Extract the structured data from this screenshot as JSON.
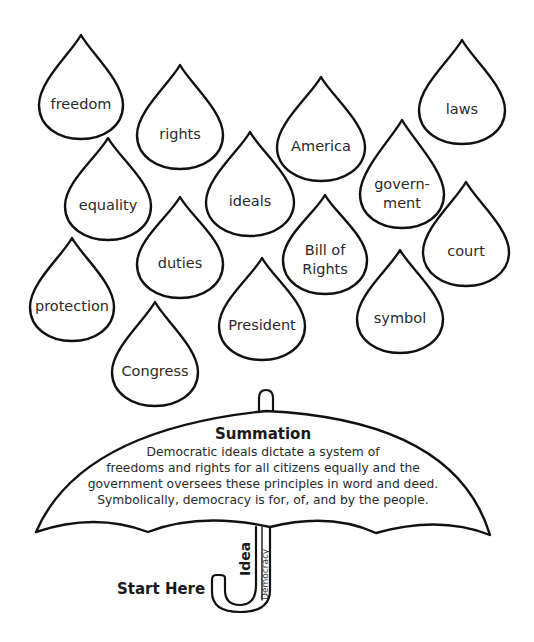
{
  "drops": [
    {
      "id": "freedom",
      "lines": [
        "freedom"
      ],
      "tip": [
        81,
        35
      ],
      "cx": 81,
      "cy": 103,
      "rx": 42,
      "ry": 36
    },
    {
      "id": "rights",
      "lines": [
        "rights"
      ],
      "tip": [
        180,
        65
      ],
      "cx": 180,
      "cy": 133,
      "rx": 43,
      "ry": 36
    },
    {
      "id": "america",
      "lines": [
        "America"
      ],
      "tip": [
        321,
        77
      ],
      "cx": 321,
      "cy": 145,
      "rx": 44,
      "ry": 36
    },
    {
      "id": "laws",
      "lines": [
        "laws"
      ],
      "tip": [
        462,
        40
      ],
      "cx": 462,
      "cy": 108,
      "rx": 43,
      "ry": 36
    },
    {
      "id": "equality",
      "lines": [
        "equality"
      ],
      "tip": [
        108,
        138
      ],
      "cx": 108,
      "cy": 204,
      "rx": 43,
      "ry": 36
    },
    {
      "id": "ideals",
      "lines": [
        "ideals"
      ],
      "tip": [
        250,
        132
      ],
      "cx": 250,
      "cy": 200,
      "rx": 44,
      "ry": 36
    },
    {
      "id": "government",
      "lines": [
        "govern-",
        "ment"
      ],
      "tip": [
        402,
        120
      ],
      "cx": 402,
      "cy": 192,
      "rx": 42,
      "ry": 36
    },
    {
      "id": "duties",
      "lines": [
        "duties"
      ],
      "tip": [
        180,
        197
      ],
      "cx": 180,
      "cy": 262,
      "rx": 43,
      "ry": 36
    },
    {
      "id": "bill-of-rights",
      "lines": [
        "Bill of",
        "Rights"
      ],
      "tip": [
        325,
        195
      ],
      "cx": 325,
      "cy": 258,
      "rx": 42,
      "ry": 36
    },
    {
      "id": "court",
      "lines": [
        "court"
      ],
      "tip": [
        466,
        182
      ],
      "cx": 466,
      "cy": 250,
      "rx": 43,
      "ry": 36
    },
    {
      "id": "protection",
      "lines": [
        "protection"
      ],
      "tip": [
        72,
        238
      ],
      "cx": 72,
      "cy": 305,
      "rx": 42,
      "ry": 36
    },
    {
      "id": "president",
      "lines": [
        "President"
      ],
      "tip": [
        262,
        258
      ],
      "cx": 262,
      "cy": 324,
      "rx": 43,
      "ry": 36
    },
    {
      "id": "symbol",
      "lines": [
        "symbol"
      ],
      "tip": [
        400,
        250
      ],
      "cx": 400,
      "cy": 317,
      "rx": 43,
      "ry": 36
    },
    {
      "id": "congress",
      "lines": [
        "Congress"
      ],
      "tip": [
        155,
        302
      ],
      "cx": 155,
      "cy": 370,
      "rx": 43,
      "ry": 36
    }
  ],
  "umbrella": {
    "title": "Summation",
    "text_lines": [
      "Democratic ideals dictate a system of",
      "freedoms and rights for all citizens equally and the",
      "government oversees these principles in word and deed.",
      "Symbolically, democracy is for, of, and by the people."
    ],
    "handle_label_left": "Idea",
    "handle_label_right": "Democracy",
    "start_label": "Start Here"
  }
}
